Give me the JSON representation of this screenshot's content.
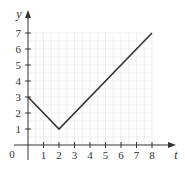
{
  "chart_data": {
    "type": "line",
    "title": "",
    "xlabel": "t",
    "ylabel": "y",
    "xlim": [
      0,
      8
    ],
    "ylim": [
      0,
      7
    ],
    "x_ticks": [
      1,
      2,
      3,
      4,
      5,
      6,
      7,
      8
    ],
    "y_ticks": [
      1,
      2,
      3,
      4,
      5,
      6,
      7
    ],
    "origin_label": "0",
    "grid": true,
    "legend": null,
    "series": [
      {
        "name": "y(t)",
        "x": [
          0,
          2,
          8
        ],
        "y": [
          3,
          1,
          7
        ],
        "color": "#333333"
      }
    ]
  },
  "colors": {
    "axis": "#333333",
    "grid": "#e4e4e4",
    "line": "#333333"
  }
}
